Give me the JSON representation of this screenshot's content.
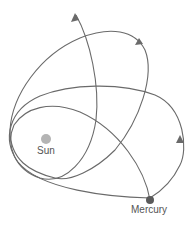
{
  "diagram": {
    "labels": {
      "sun": "Sun",
      "mercury": "Mercury"
    },
    "bodies": [
      {
        "name": "Sun",
        "color": "#b4b4b4",
        "cx": 46,
        "cy": 139,
        "r": 5
      },
      {
        "name": "Mercury",
        "color": "#5a5a5a",
        "cx": 150,
        "cy": 200,
        "r": 4
      }
    ],
    "orbit_color": "#6a6a6a",
    "orbits": [
      {
        "id": "orbit-horizontal",
        "direction": "counterclockwise",
        "arrow_at": [
          180,
          138
        ]
      },
      {
        "id": "orbit-tilted",
        "direction": "counterclockwise",
        "arrow_at": [
          140,
          40
        ]
      },
      {
        "id": "orbit-steep",
        "direction": "counterclockwise",
        "arrow_at": [
          75,
          14
        ]
      }
    ]
  }
}
